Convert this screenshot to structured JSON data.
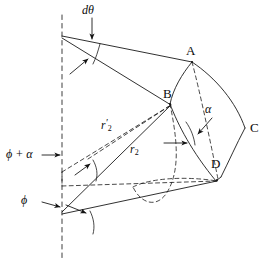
{
  "figure": {
    "caption_present": false,
    "background_color": "#ffffff",
    "stroke_color": "#1a1a1a",
    "axis_style": "dashed-vertical"
  },
  "labels": {
    "d_theta": "dθ",
    "phi_plus_alpha": "ϕ + α",
    "phi": "ϕ",
    "alpha": "α",
    "r2_prime_base": "r",
    "r2_prime_sub": "2",
    "r2_base": "r",
    "r2_sub": "2",
    "point_a": "A",
    "point_b": "B",
    "point_c": "C",
    "point_d": "D"
  },
  "geometry": {
    "axis_x": 62,
    "axis_top_y": 15,
    "axis_bottom_y": 258,
    "apex_top": [
      62,
      36
    ],
    "apex_bottom": [
      62,
      213
    ],
    "point_a": [
      192,
      62
    ],
    "point_b": [
      170,
      104
    ],
    "point_c": [
      245,
      128
    ],
    "point_d": [
      221,
      177
    ],
    "point_lower_left_dash": [
      62,
      172
    ],
    "point_lower_right": [
      216,
      181
    ]
  }
}
